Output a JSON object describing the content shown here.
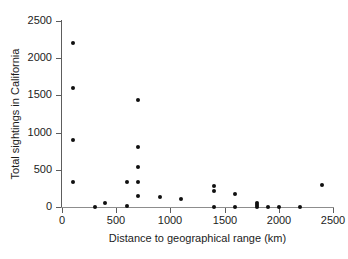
{
  "chart_data": {
    "type": "scatter",
    "title": "",
    "xlabel": "Distance to geographical range (km)",
    "ylabel": "Total sightings in California",
    "xlim": [
      0,
      2500
    ],
    "ylim": [
      0,
      2500
    ],
    "xticks": [
      0,
      500,
      1000,
      1500,
      2000,
      2500
    ],
    "yticks": [
      0,
      500,
      1000,
      1500,
      2000,
      2500
    ],
    "xtick_labels": [
      "0",
      "500",
      "1000",
      "1500",
      "2000",
      "2500"
    ],
    "ytick_labels": [
      "0",
      "500",
      "1000",
      "1500",
      "2000",
      "2500"
    ],
    "grid": false,
    "legend": "none",
    "marker": "filled-circle",
    "marker_color": "#101010",
    "series": [
      {
        "name": "species",
        "points": [
          {
            "x": 100,
            "y": 2200
          },
          {
            "x": 100,
            "y": 1600
          },
          {
            "x": 100,
            "y": 900
          },
          {
            "x": 100,
            "y": 330
          },
          {
            "x": 300,
            "y": 0
          },
          {
            "x": 400,
            "y": 60
          },
          {
            "x": 600,
            "y": 330
          },
          {
            "x": 600,
            "y": 20
          },
          {
            "x": 700,
            "y": 1440
          },
          {
            "x": 700,
            "y": 800
          },
          {
            "x": 700,
            "y": 540
          },
          {
            "x": 700,
            "y": 330
          },
          {
            "x": 700,
            "y": 150
          },
          {
            "x": 900,
            "y": 140
          },
          {
            "x": 1100,
            "y": 110
          },
          {
            "x": 1400,
            "y": 280
          },
          {
            "x": 1400,
            "y": 220
          },
          {
            "x": 1400,
            "y": 0
          },
          {
            "x": 1600,
            "y": 170
          },
          {
            "x": 1600,
            "y": 0
          },
          {
            "x": 1800,
            "y": 60
          },
          {
            "x": 1800,
            "y": 30
          },
          {
            "x": 1800,
            "y": 0
          },
          {
            "x": 1900,
            "y": 0
          },
          {
            "x": 2000,
            "y": 0
          },
          {
            "x": 2200,
            "y": 0
          },
          {
            "x": 2400,
            "y": 300
          }
        ]
      }
    ]
  }
}
